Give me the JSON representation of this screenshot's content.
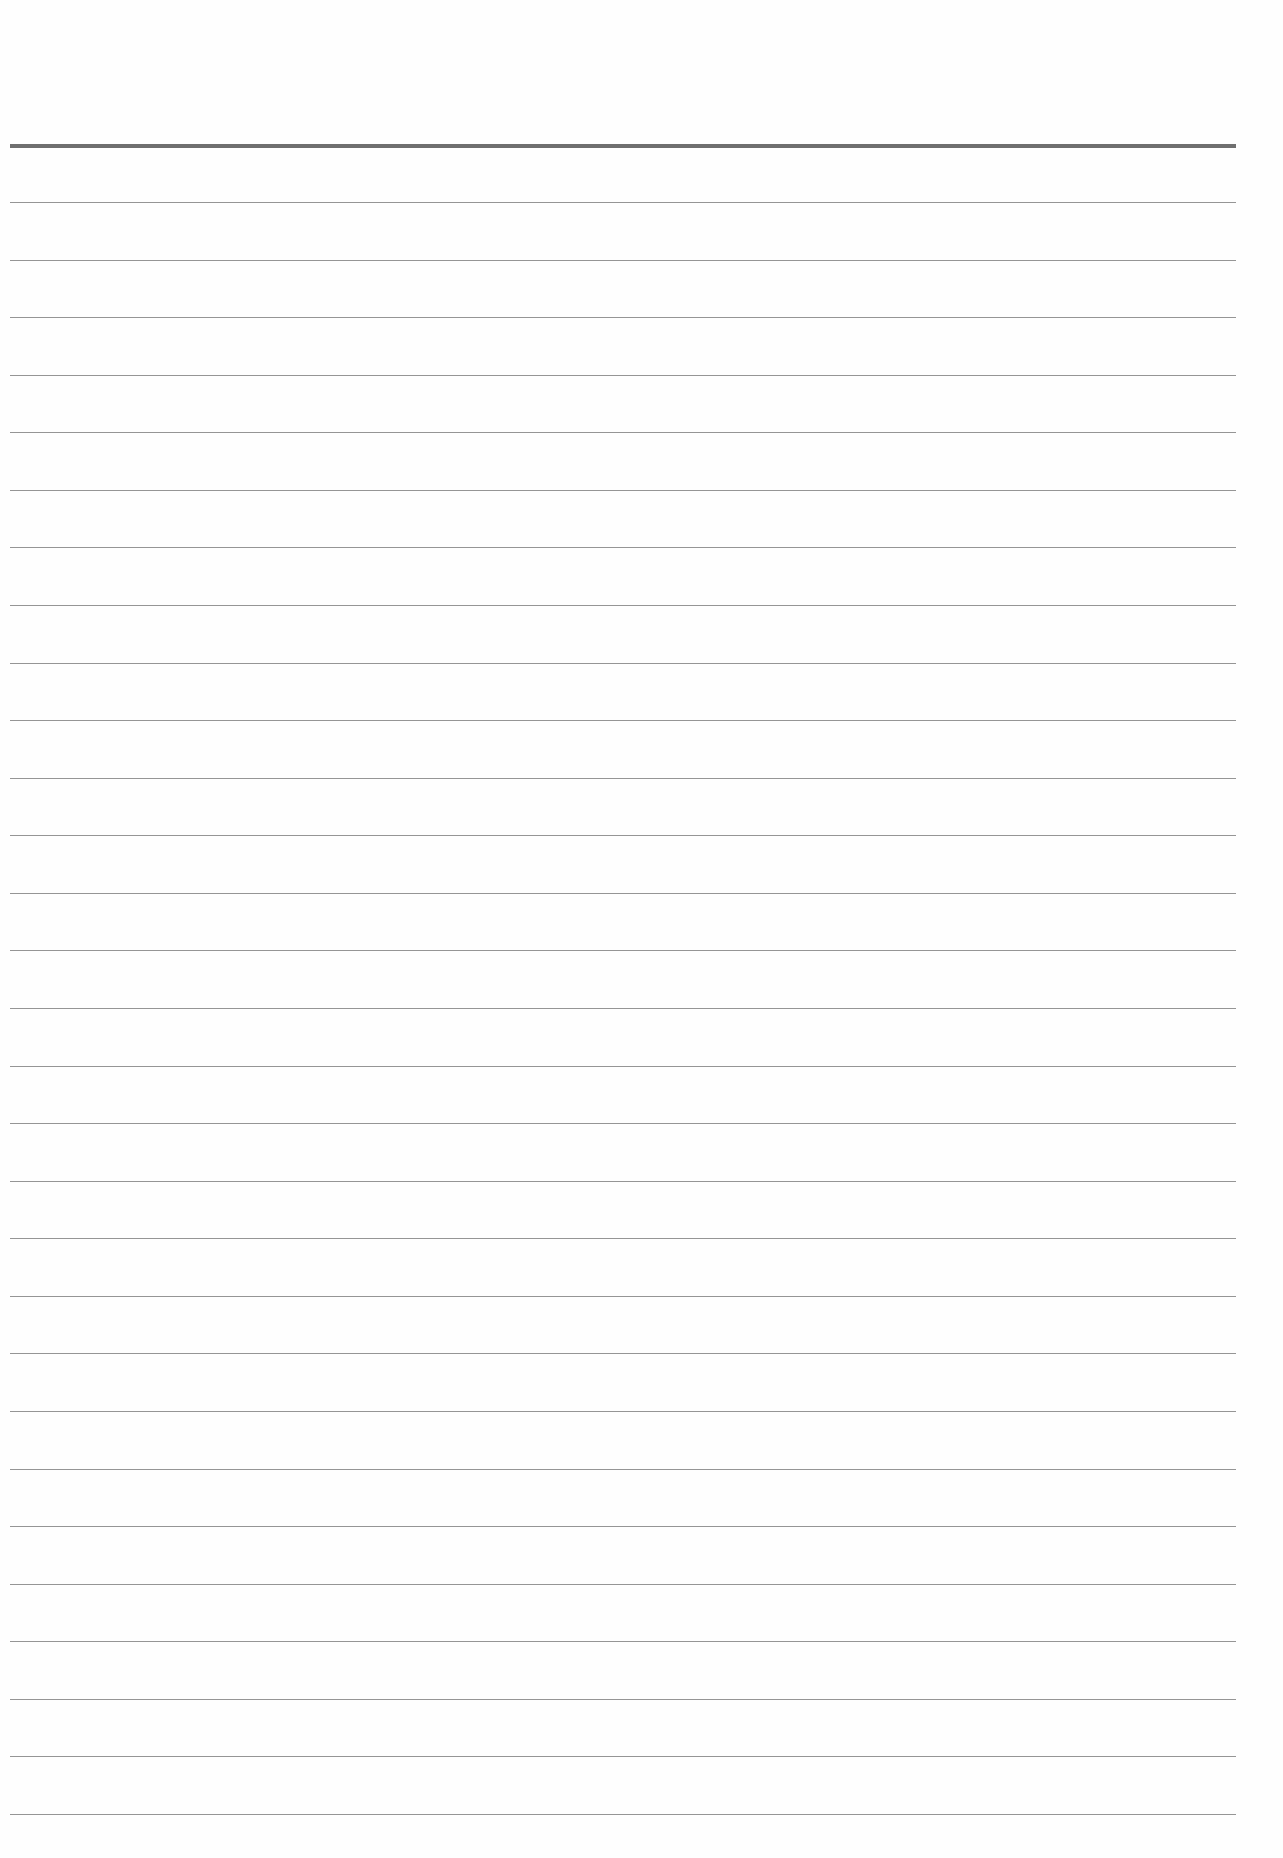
{
  "page": {
    "type": "lined-paper",
    "background_color": "#fefefe",
    "header_rule": {
      "y": 144,
      "thickness": 4,
      "color": "#6f6f6f"
    },
    "lines": {
      "count": 29,
      "first_y": 202,
      "spacing": 57.57,
      "thickness": 1,
      "color": "#8a8a8a",
      "x_start": 10,
      "x_end": 1236
    },
    "text_content": ""
  }
}
